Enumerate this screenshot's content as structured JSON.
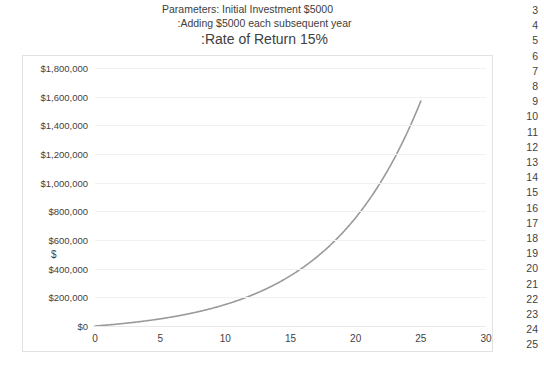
{
  "chart_title": {
    "line1": "Parameters: Initial Investment $5000",
    "line2": ":Adding $5000 each subsequent year",
    "line3": ":Rate of Return 15%"
  },
  "axes": {
    "y_axis_title": "$",
    "x_axis_title": "Years",
    "y_tick_labels": [
      "$1,800,000",
      "$1,600,000",
      "$1,400,000",
      "$1,200,000",
      "$1,000,000",
      "$800,000",
      "$600,000",
      "$400,000",
      "$200,000",
      "$0"
    ],
    "x_tick_labels": [
      "0",
      "5",
      "10",
      "15",
      "20",
      "25",
      "30"
    ]
  },
  "spreadsheet": {
    "row_numbers": [
      "3",
      "4",
      "5",
      "6",
      "7",
      "8",
      "9",
      "10",
      "11",
      "12",
      "13",
      "14",
      "15",
      "16",
      "17",
      "18",
      "19",
      "20",
      "21",
      "22",
      "23",
      "24",
      "25"
    ]
  },
  "colors": {
    "series_line": "#9a9a9a",
    "gridline": "#f0f0f0",
    "frame_border": "#e2e2e2",
    "text": "#3f3f3f"
  },
  "chart_data": {
    "type": "line",
    "title": "Parameters: Initial Investment $5000 :Adding $5000 each subsequent year :Rate of Return 15%",
    "xlabel": "Years",
    "ylabel": "$",
    "xlim": [
      0,
      30
    ],
    "ylim": [
      0,
      1800000
    ],
    "xticks": [
      0,
      5,
      10,
      15,
      20,
      25,
      30
    ],
    "yticks": [
      0,
      200000,
      400000,
      600000,
      800000,
      1000000,
      1200000,
      1400000,
      1600000,
      1800000
    ],
    "grid": true,
    "legend": null,
    "series": [
      {
        "name": "Investment Value",
        "x": [
          1,
          2,
          3,
          4,
          5,
          6,
          7,
          8,
          9,
          10,
          11,
          12,
          13,
          14,
          15,
          16,
          17,
          18,
          19,
          20,
          21,
          22,
          23,
          24,
          25
        ],
        "values": [
          5750,
          12613,
          20504,
          29330,
          38979,
          49326,
          60225,
          71509,
          82985,
          94433,
          105598,
          116187,
          125865,
          134245,
          140881,
          145263,
          146803,
          144823,
          138546,
          127078,
          109390,
          84299,
          50444,
          6261,
          1570000
        ]
      }
    ],
    "annotations": [
      "Initial Investment $5000",
      "Adding $5000 each subsequent year",
      "Rate of Return 15%"
    ]
  }
}
